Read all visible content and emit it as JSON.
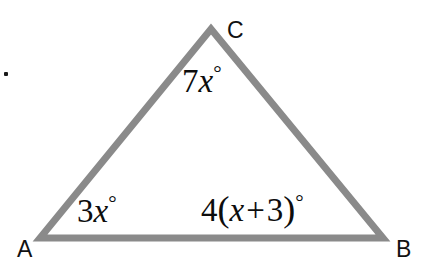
{
  "figure": {
    "type": "triangle-diagram",
    "background_color": "#ffffff",
    "stroke_color": "#8a8a8a",
    "stroke_width": 7,
    "text_color": "#0d0d0d"
  },
  "vertices": {
    "a": {
      "label": "A",
      "x": 40,
      "y": 238
    },
    "b": {
      "label": "B",
      "x": 383,
      "y": 238
    },
    "c": {
      "label": "C",
      "x": 211,
      "y": 29
    }
  },
  "angles": {
    "at_a": {
      "coefficient": "3",
      "variable": "x",
      "degree_symbol": "°",
      "expression": "3x°"
    },
    "at_b": {
      "coefficient": "4",
      "open_paren": "(",
      "variable": "x",
      "operator": "+",
      "constant": "3",
      "close_paren": ")",
      "degree_symbol": "°",
      "expression": "4(x + 3)°"
    },
    "at_c": {
      "coefficient": "7",
      "variable": "x",
      "degree_symbol": "°",
      "expression": "7x°"
    }
  }
}
